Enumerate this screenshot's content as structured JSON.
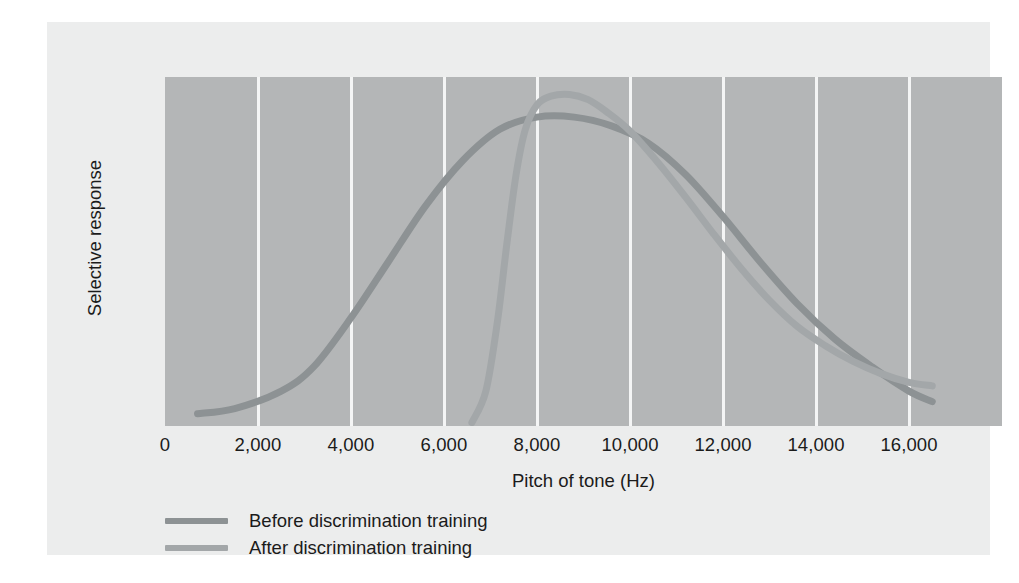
{
  "figure": {
    "background_color": "#eceded",
    "plot_background_color": "#b4b6b7",
    "gridline_color": "#f4f5f5"
  },
  "chart_data": {
    "type": "line",
    "title": "",
    "subtitle": "",
    "xlabel": "Pitch of tone (Hz)",
    "ylabel": "Selective response",
    "xlim": [
      0,
      18000
    ],
    "ylim": [
      0,
      1
    ],
    "xticks": [
      0,
      2000,
      4000,
      6000,
      8000,
      10000,
      12000,
      14000,
      16000
    ],
    "xtick_labels": [
      "0",
      "2,000",
      "4,000",
      "6,000",
      "8,000",
      "10,000",
      "12,000",
      "14,000",
      "16,000"
    ],
    "yticks": [],
    "ytick_labels": [],
    "grid": "vertical-only",
    "legend_position": "below-axis-left",
    "annotations": [],
    "series": [
      {
        "name": "Before discrimination training",
        "color": "#8d9294",
        "line_width": 7,
        "x": [
          700,
          1500,
          2500,
          3200,
          4000,
          4800,
          5600,
          6400,
          7200,
          8000,
          8800,
          9600,
          10400,
          11200,
          12000,
          12800,
          13600,
          14400,
          15200,
          16000,
          16500
        ],
        "y": [
          0.035,
          0.05,
          0.1,
          0.17,
          0.31,
          0.47,
          0.63,
          0.76,
          0.85,
          0.885,
          0.885,
          0.86,
          0.81,
          0.72,
          0.6,
          0.47,
          0.35,
          0.25,
          0.17,
          0.1,
          0.07
        ]
      },
      {
        "name": "After discrimination training",
        "color": "#a3a7a9",
        "line_width": 7,
        "x": [
          6600,
          6900,
          7150,
          7350,
          7550,
          7750,
          8000,
          8300,
          8700,
          9100,
          9500,
          10000,
          10600,
          11200,
          11800,
          12400,
          13000,
          13600,
          14200,
          14800,
          15400,
          16000,
          16500
        ],
        "y": [
          0.01,
          0.1,
          0.3,
          0.52,
          0.72,
          0.85,
          0.92,
          0.945,
          0.95,
          0.935,
          0.9,
          0.845,
          0.755,
          0.655,
          0.55,
          0.45,
          0.36,
          0.285,
          0.23,
          0.185,
          0.15,
          0.125,
          0.115
        ]
      }
    ]
  },
  "legend": {
    "items": [
      {
        "label": "Before discrimination training",
        "color": "#8d9294"
      },
      {
        "label": "After discrimination training",
        "color": "#a3a7a9"
      }
    ]
  }
}
